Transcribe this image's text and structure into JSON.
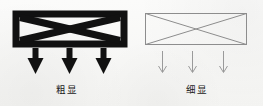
{
  "figure": {
    "type": "comparison-illustration",
    "background_color": "#f8f8f6",
    "ink_color": "#111111",
    "thin_line_color": "#8d8d8d",
    "panels": [
      {
        "id": "bold",
        "caption": "粗显",
        "shape": {
          "name": "rectangle-with-x-cross",
          "style": "bold",
          "border_width_px": 7,
          "cross_width_px": 7
        },
        "arrows": {
          "count": 3,
          "direction": "down",
          "style": "thick-solid-head"
        }
      },
      {
        "id": "thin",
        "caption": "细显",
        "shape": {
          "name": "rectangle-with-x-cross",
          "style": "thin",
          "border_width_px": 1,
          "cross_width_px": 1
        },
        "arrows": {
          "count": 3,
          "direction": "down",
          "style": "thin-open-head"
        }
      }
    ]
  }
}
